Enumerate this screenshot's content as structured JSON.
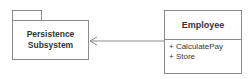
{
  "diagram": {
    "type": "uml-class-dependency",
    "package": {
      "name_lines": [
        "Persistence",
        "Subsystem"
      ]
    },
    "class": {
      "name": "Employee",
      "operations": [
        "+ CalculatePay",
        "+ Store"
      ]
    },
    "relationship": {
      "from": "Employee",
      "to": "Persistence Subsystem",
      "arrow": "open-arrowhead",
      "line_color": "#8a8a8a"
    }
  }
}
